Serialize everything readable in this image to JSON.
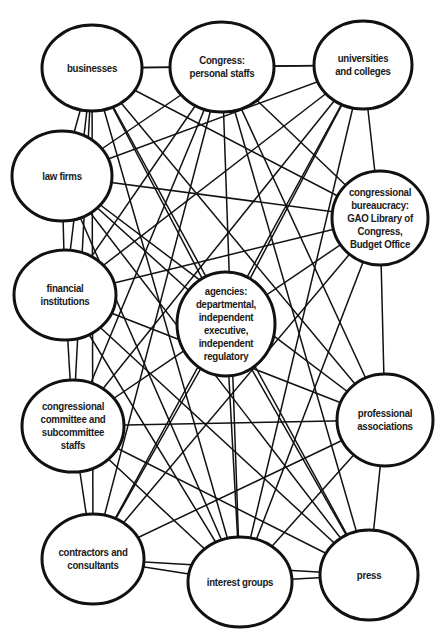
{
  "diagram": {
    "type": "network",
    "edge_note": "adjacency edges are directly visible; background_web is an approximate reconstruction of the dense crossing lines",
    "nodes": [
      {
        "id": "businesses",
        "label": "businesses",
        "cx": 92,
        "cy": 68,
        "rx": 50,
        "ry": 43
      },
      {
        "id": "congress_personal",
        "label": "Congress:\npersonal staffs",
        "cx": 222,
        "cy": 67,
        "rx": 52,
        "ry": 45
      },
      {
        "id": "universities",
        "label": "universities\nand colleges",
        "cx": 363,
        "cy": 65,
        "rx": 49,
        "ry": 44
      },
      {
        "id": "law_firms",
        "label": "law firms",
        "cx": 62,
        "cy": 176,
        "rx": 50,
        "ry": 45
      },
      {
        "id": "congressional_bureaucracy",
        "label": "congressional\nbureaucracy:\nGAO Library of\nCongress,\nBudget Office",
        "cx": 380,
        "cy": 218,
        "rx": 48,
        "ry": 47
      },
      {
        "id": "financial_institutions",
        "label": "financial\ninstitutions",
        "cx": 65,
        "cy": 295,
        "rx": 51,
        "ry": 45
      },
      {
        "id": "agencies",
        "label": "agencies:\ndepartmental,\nindependent\nexecutive,\nindependent\nregulatory",
        "cx": 226,
        "cy": 324,
        "rx": 49,
        "ry": 52
      },
      {
        "id": "congressional_committee",
        "label": "congressional\ncommittee and\nsubcommittee\nstaffs",
        "cx": 73,
        "cy": 426,
        "rx": 51,
        "ry": 46
      },
      {
        "id": "professional_associations",
        "label": "professional\nassociations",
        "cx": 385,
        "cy": 420,
        "rx": 48,
        "ry": 46
      },
      {
        "id": "contractors",
        "label": "contractors and\nconsultants",
        "cx": 93,
        "cy": 559,
        "rx": 51,
        "ry": 45
      },
      {
        "id": "interest_groups",
        "label": "interest groups",
        "cx": 240,
        "cy": 582,
        "rx": 52,
        "ry": 45
      },
      {
        "id": "press",
        "label": "press",
        "cx": 369,
        "cy": 575,
        "rx": 49,
        "ry": 45
      }
    ],
    "adjacency_edges": [
      [
        "businesses",
        "congress_personal"
      ],
      [
        "congress_personal",
        "universities"
      ],
      [
        "businesses",
        "law_firms"
      ],
      [
        "law_firms",
        "financial_institutions"
      ],
      [
        "financial_institutions",
        "congressional_committee"
      ],
      [
        "congressional_committee",
        "contractors"
      ],
      [
        "contractors",
        "interest_groups"
      ],
      [
        "interest_groups",
        "press"
      ],
      [
        "universities",
        "congressional_bureaucracy"
      ],
      [
        "congressional_bureaucracy",
        "professional_associations"
      ],
      [
        "professional_associations",
        "press"
      ]
    ],
    "background_web": [
      [
        "businesses",
        "congressional_bureaucracy"
      ],
      [
        "businesses",
        "financial_institutions"
      ],
      [
        "businesses",
        "congressional_committee"
      ],
      [
        "businesses",
        "contractors"
      ],
      [
        "businesses",
        "interest_groups"
      ],
      [
        "businesses",
        "press"
      ],
      [
        "businesses",
        "professional_associations"
      ],
      [
        "businesses",
        "agencies"
      ],
      [
        "congress_personal",
        "law_firms"
      ],
      [
        "congress_personal",
        "financial_institutions"
      ],
      [
        "congress_personal",
        "congressional_committee"
      ],
      [
        "congress_personal",
        "contractors"
      ],
      [
        "congress_personal",
        "interest_groups"
      ],
      [
        "congress_personal",
        "press"
      ],
      [
        "congress_personal",
        "professional_associations"
      ],
      [
        "congress_personal",
        "congressional_bureaucracy"
      ],
      [
        "universities",
        "law_firms"
      ],
      [
        "universities",
        "financial_institutions"
      ],
      [
        "universities",
        "congressional_committee"
      ],
      [
        "universities",
        "contractors"
      ],
      [
        "universities",
        "interest_groups"
      ],
      [
        "universities",
        "agencies"
      ],
      [
        "universities",
        "businesses"
      ],
      [
        "law_firms",
        "congressional_bureaucracy"
      ],
      [
        "law_firms",
        "professional_associations"
      ],
      [
        "law_firms",
        "interest_groups"
      ],
      [
        "law_firms",
        "press"
      ],
      [
        "law_firms",
        "agencies"
      ],
      [
        "financial_institutions",
        "congressional_bureaucracy"
      ],
      [
        "financial_institutions",
        "professional_associations"
      ],
      [
        "financial_institutions",
        "interest_groups"
      ],
      [
        "financial_institutions",
        "press"
      ],
      [
        "congressional_committee",
        "congressional_bureaucracy"
      ],
      [
        "congressional_committee",
        "professional_associations"
      ],
      [
        "congressional_committee",
        "interest_groups"
      ],
      [
        "congressional_committee",
        "press"
      ],
      [
        "contractors",
        "professional_associations"
      ],
      [
        "contractors",
        "press"
      ],
      [
        "contractors",
        "congressional_bureaucracy"
      ],
      [
        "contractors",
        "agencies"
      ],
      [
        "agencies",
        "interest_groups"
      ],
      [
        "agencies",
        "press"
      ],
      [
        "interest_groups",
        "congressional_bureaucracy"
      ],
      [
        "interest_groups",
        "professional_associations"
      ]
    ]
  }
}
